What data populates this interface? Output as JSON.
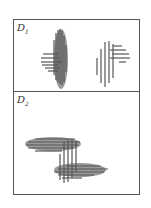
{
  "panels": [
    {
      "id": "D1",
      "label": "D",
      "subscript": "1"
    },
    {
      "id": "D2",
      "label": "D",
      "subscript": "2"
    }
  ],
  "colors": {
    "stroke": "#555555",
    "fill": "#888888",
    "border": "#555555"
  }
}
